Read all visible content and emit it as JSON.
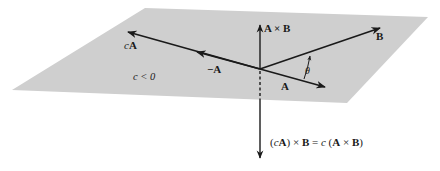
{
  "diagram": {
    "colors": {
      "plane": "#cfcfcf",
      "vector": "#1a1a1a",
      "background": "#ffffff"
    },
    "labels": {
      "cA": "cA",
      "cA_c": "c",
      "cA_A": "A",
      "negA": "−A",
      "condition": "c < 0",
      "A": "A",
      "B": "B",
      "AxB": "A × B",
      "theta": "θ",
      "equation": "(cA) × B = c (A × B)"
    },
    "equation_parts": {
      "p1": "(",
      "c1": "c",
      "A1": "A",
      "p2": ") × ",
      "B1": "B",
      "eq": " = ",
      "c2": "c",
      "p3": " (",
      "A2": "A",
      "x": " × ",
      "B2": "B",
      "p4": ")"
    },
    "vectors": [
      {
        "name": "A",
        "from": [
          260,
          69
        ],
        "to": [
          325,
          87
        ]
      },
      {
        "name": "B",
        "from": [
          260,
          69
        ],
        "to": [
          380,
          28
        ]
      },
      {
        "name": "-A",
        "from": [
          260,
          69
        ],
        "to": [
          196,
          52
        ]
      },
      {
        "name": "cA",
        "from": [
          260,
          69
        ],
        "to": [
          127,
          32
        ]
      },
      {
        "name": "A x B",
        "from": [
          260,
          69
        ],
        "to": [
          260,
          25
        ]
      },
      {
        "name": "(cA) x B",
        "from": [
          260,
          69
        ],
        "to": [
          260,
          158
        ]
      }
    ]
  }
}
